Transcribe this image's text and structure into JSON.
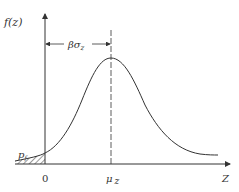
{
  "diagram": {
    "type": "probability-density-curve",
    "y_axis_label": "f(z)",
    "x_axis_label": "Z",
    "origin_label": "0",
    "mean_label_mu": "μ",
    "mean_label_sub": "z",
    "span_label_beta": "βσ",
    "span_label_sub": "z",
    "tail_label_p": "p",
    "tail_label_sub": "f",
    "colors": {
      "line": "#333333",
      "background": "#ffffff"
    }
  }
}
